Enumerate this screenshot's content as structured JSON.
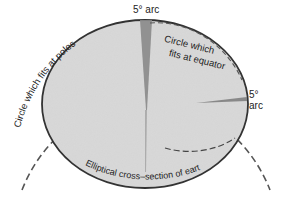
{
  "diagram": {
    "labels": {
      "top_arc": "5° arc",
      "right_arc_deg": "5°",
      "right_arc_word": "arc",
      "poles_circle": "Circle which fits at poles",
      "equator_circle_line1": "Circle which",
      "equator_circle_line2": "fits at equator",
      "ellipse": "Elliptical cross–section of earth"
    },
    "colors": {
      "ellipse_fill": "#d9d9d9",
      "ellipse_stroke": "#333333",
      "wedge": "#8a8a8a",
      "dashed": "#555555",
      "background": "#ffffff"
    }
  }
}
